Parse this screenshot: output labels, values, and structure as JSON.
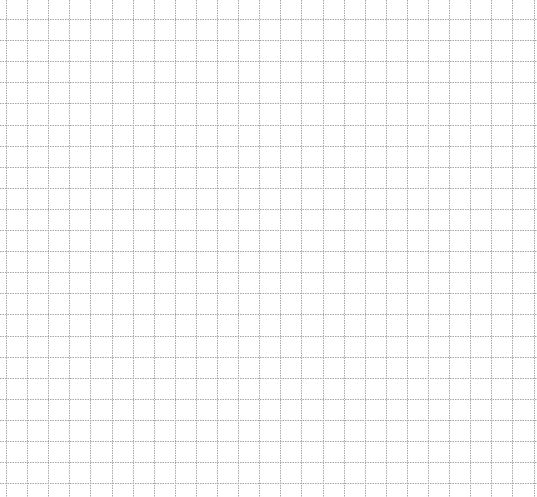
{
  "sheet": {
    "type": "graph-paper",
    "background": "#ffffff",
    "line_color": "#a8a8a8",
    "cell_size_px": 21.1,
    "origin_x": 6,
    "origin_y": 19,
    "columns": 25,
    "rows": 23
  }
}
